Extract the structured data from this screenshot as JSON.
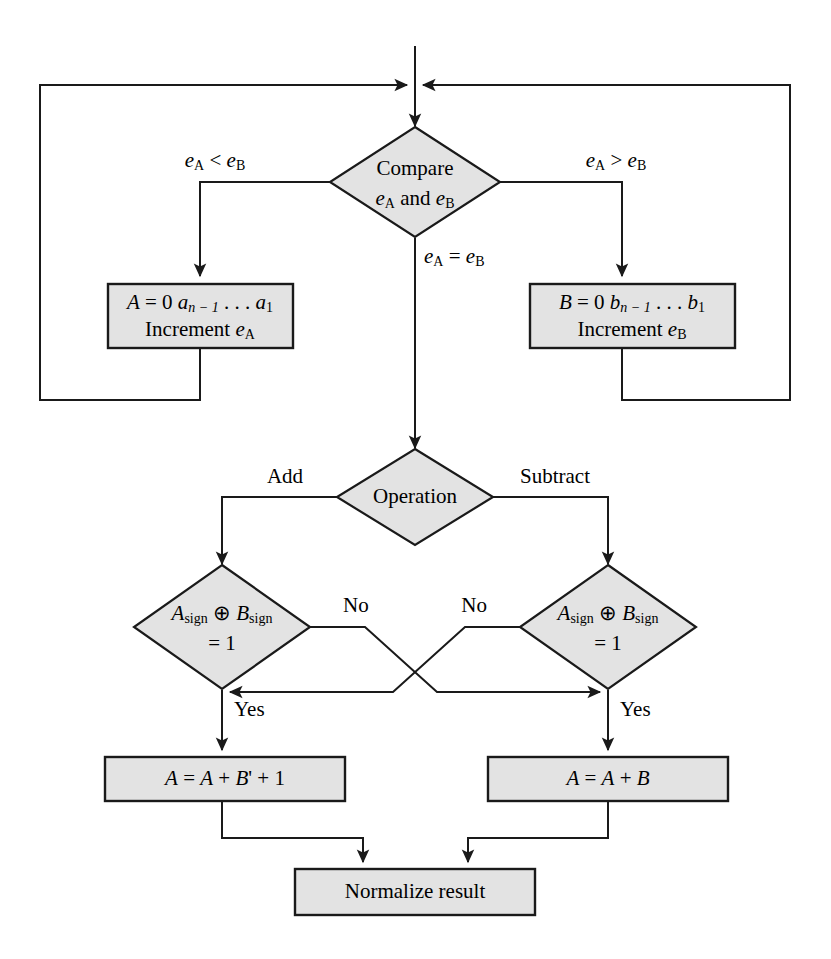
{
  "diagram": {
    "colors": {
      "node_fill": "#e3e3e3",
      "stroke": "#1a1a1a",
      "background": "#ffffff",
      "text": "#000000"
    },
    "nodes": [
      {
        "id": "compare",
        "type": "decision",
        "lines": [
          "Compare",
          "e_A and e_B"
        ],
        "line1": "Compare",
        "line2_pre": "e",
        "line2_sub1": "A",
        "line2_mid": " and ",
        "line2_var2": "e",
        "line2_sub2": "B"
      },
      {
        "id": "shift-a",
        "type": "process",
        "line1": "A = 0 a_{n-1} . . . a_1",
        "line2": "Increment e_A",
        "l1_A": "A",
        "l1_eq": " = 0 ",
        "l1_a": "a",
        "l1_sub": "n − 1",
        "l1_dots": " . . . ",
        "l1_a2": "a",
        "l1_sub2": "1",
        "l2_text": "Increment ",
        "l2_var": "e",
        "l2_sub": "A"
      },
      {
        "id": "shift-b",
        "type": "process",
        "line1": "B = 0 b_{n-1} . . . b_1",
        "line2": "Increment e_B",
        "l1_A": "B",
        "l1_eq": " = 0 ",
        "l1_a": "b",
        "l1_sub": "n − 1",
        "l1_dots": " . . . ",
        "l1_a2": "b",
        "l1_sub2": "1",
        "l2_text": "Increment ",
        "l2_var": "e",
        "l2_sub": "B"
      },
      {
        "id": "operation",
        "type": "decision",
        "label": "Operation"
      },
      {
        "id": "sign-check-left",
        "type": "decision",
        "line1_a": "A",
        "line1_asub": "sign",
        "line1_op": " ⊕ ",
        "line1_b": "B",
        "line1_bsub": "sign",
        "line2": "= 1"
      },
      {
        "id": "sign-check-right",
        "type": "decision",
        "line1_a": "A",
        "line1_asub": "sign",
        "line1_op": " ⊕ ",
        "line1_b": "B",
        "line1_bsub": "sign",
        "line2": "= 1"
      },
      {
        "id": "add-complement",
        "type": "process",
        "label": "A = A + B' + 1",
        "p1": "A",
        "p2": " = ",
        "p3": "A",
        "p4": " + ",
        "p5": "B",
        "p6": "' + 1"
      },
      {
        "id": "add-plain",
        "type": "process",
        "label": "A = A + B",
        "p1": "A",
        "p2": " = ",
        "p3": "A",
        "p4": " + ",
        "p5": "B"
      },
      {
        "id": "normalize",
        "type": "process",
        "label": "Normalize result"
      }
    ],
    "edge_labels": {
      "less_than": {
        "var1": "e",
        "sub1": "A",
        "op": " < ",
        "var2": "e",
        "sub2": "B"
      },
      "greater_than": {
        "var1": "e",
        "sub1": "A",
        "op": " > ",
        "var2": "e",
        "sub2": "B"
      },
      "equal": {
        "var1": "e",
        "sub1": "A",
        "op": " = ",
        "var2": "e",
        "sub2": "B"
      },
      "add": "Add",
      "subtract": "Subtract",
      "no_left": "No",
      "no_right": "No",
      "yes_left": "Yes",
      "yes_right": "Yes"
    }
  }
}
